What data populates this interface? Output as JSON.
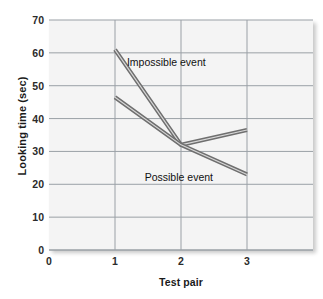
{
  "chart_data": {
    "type": "line",
    "title": "",
    "xlabel": "Test pair",
    "ylabel": "Looking time (sec)",
    "x": [
      1,
      2,
      3
    ],
    "xlim": [
      0,
      4
    ],
    "ylim": [
      0,
      70
    ],
    "xticks": [
      "0",
      "1",
      "2",
      "3"
    ],
    "xtick_values": [
      0,
      1,
      2,
      3
    ],
    "yticks": [
      "0",
      "10",
      "20",
      "30",
      "40",
      "50",
      "60",
      "70"
    ],
    "ytick_values": [
      0,
      10,
      20,
      30,
      40,
      50,
      60,
      70
    ],
    "grid": true,
    "legend_position": "inline-annotations",
    "series": [
      {
        "name": "Impossible event",
        "values": [
          61,
          32,
          36.5
        ],
        "color": "#8a8a8a",
        "label_x": 1.18,
        "label_y": 57
      },
      {
        "name": "Possible event",
        "values": [
          46.5,
          32,
          23
        ],
        "color": "#8a8a8a",
        "label_x": 1.45,
        "label_y": 22
      }
    ],
    "colors": {
      "line": "#8a8a8a",
      "grid": "#9aa0a6",
      "plot_background": "#f4f4f4",
      "axis": "#555555",
      "text": "#1a1a1a"
    }
  },
  "annotations": {
    "impossible_label": "Impossible event",
    "possible_label": "Possible event"
  }
}
